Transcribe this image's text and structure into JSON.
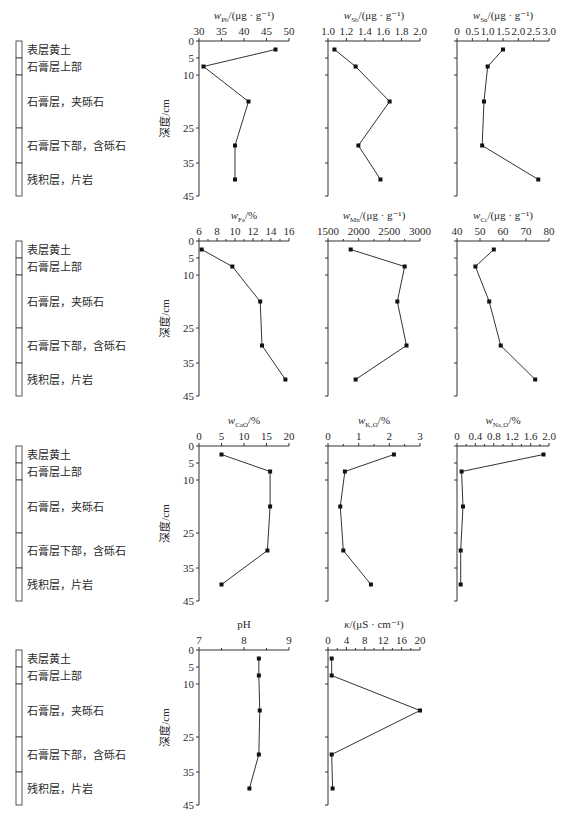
{
  "figure": {
    "depth_axis": {
      "label": "深度/cm",
      "ticks": [
        0,
        5,
        10,
        25,
        35,
        45
      ],
      "tick_offsets_px": [
        0,
        17,
        34,
        87,
        122,
        155
      ],
      "axis_length_px": 155
    },
    "stratigraphy": {
      "layers": [
        {
          "label": "表层黄土",
          "top": 0,
          "bottom": 5
        },
        {
          "label": "石膏层上部",
          "top": 5,
          "bottom": 10
        },
        {
          "label": "石膏层，夹砾石",
          "top": 10,
          "bottom": 25
        },
        {
          "label": "石膏层下部，含砾石",
          "top": 25,
          "bottom": 35
        },
        {
          "label": "残积层，片岩",
          "top": 35,
          "bottom": 45
        }
      ]
    },
    "sample_depths_cm": [
      2.5,
      7.5,
      17.5,
      30,
      40
    ],
    "sample_offsets_px": [
      8.5,
      25.5,
      60.5,
      104.5,
      138.5
    ]
  },
  "chart_data": [
    {
      "type": "line",
      "row": 0,
      "col": 0,
      "title": "w_Pb/(μg·g⁻¹)",
      "title_main": "w",
      "title_sub": "Pb",
      "title_tail": "/(μg · g⁻¹)",
      "xlim": [
        30,
        50
      ],
      "xticks": [
        30,
        35,
        40,
        45,
        50
      ],
      "xtick_labels": [
        "30",
        "35",
        "40",
        "45",
        "50"
      ],
      "minor": 0,
      "ylabel": "深度/cm",
      "depths": [
        2.5,
        7.5,
        17.5,
        30,
        40
      ],
      "values": [
        47,
        31,
        41,
        38,
        38
      ]
    },
    {
      "type": "line",
      "row": 0,
      "col": 1,
      "title": "w_Sb/(μg·g⁻¹)",
      "title_main": "w",
      "title_sub": "Sb",
      "title_tail": "/(μg · g⁻¹)",
      "xlim": [
        1.0,
        2.0
      ],
      "xticks": [
        1.0,
        1.2,
        1.4,
        1.6,
        1.8,
        2.0
      ],
      "xtick_labels": [
        "1.0",
        "1.2",
        "1.4",
        "1.6",
        "1.8",
        "2.0"
      ],
      "minor": 0,
      "depths": [
        2.5,
        7.5,
        17.5,
        30,
        40
      ],
      "values": [
        1.07,
        1.3,
        1.67,
        1.33,
        1.57
      ]
    },
    {
      "type": "line",
      "row": 0,
      "col": 2,
      "title": "w_Sn/(μg·g⁻¹)",
      "title_main": "w",
      "title_sub": "Sn",
      "title_tail": "/(μg · g⁻¹)",
      "xlim": [
        0,
        3.0
      ],
      "xticks": [
        0,
        0.5,
        1.0,
        1.5,
        2.0,
        2.5,
        3.0
      ],
      "xtick_labels": [
        "0",
        "0.5",
        "1.0",
        "1.5",
        "2.0",
        "2.5",
        "3.0"
      ],
      "minor": 0,
      "depths": [
        2.5,
        7.5,
        17.5,
        30,
        40
      ],
      "values": [
        1.5,
        1.0,
        0.88,
        0.82,
        2.65
      ]
    },
    {
      "type": "line",
      "row": 1,
      "col": 0,
      "title": "w_Fe/%",
      "title_main": "w",
      "title_sub": "Fe",
      "title_tail": "/%",
      "xlim": [
        6,
        16
      ],
      "xticks": [
        6,
        8,
        10,
        12,
        14,
        16
      ],
      "xtick_labels": [
        "6",
        "8",
        "10",
        "12",
        "14",
        "16"
      ],
      "minor": 1,
      "ylabel": "深度/cm",
      "depths": [
        2.5,
        7.5,
        17.5,
        30,
        40
      ],
      "values": [
        6.3,
        9.7,
        12.8,
        13.0,
        15.6
      ]
    },
    {
      "type": "line",
      "row": 1,
      "col": 1,
      "title": "w_Mn/(μg·g⁻¹)",
      "title_main": "w",
      "title_sub": "Mn",
      "title_tail": "/(μg · g⁻¹)",
      "xlim": [
        1500,
        3000
      ],
      "xticks": [
        1500,
        2000,
        2500,
        3000
      ],
      "xtick_labels": [
        "1500",
        "2000",
        "2500",
        "3000"
      ],
      "minor": 1,
      "depths": [
        2.5,
        7.5,
        17.5,
        30,
        40
      ],
      "values": [
        1870,
        2750,
        2630,
        2780,
        1950
      ]
    },
    {
      "type": "line",
      "row": 1,
      "col": 2,
      "title": "w_Cr/(μg·g⁻¹)",
      "title_main": "w",
      "title_sub": "Cr",
      "title_tail": "/(μg · g⁻¹)",
      "xlim": [
        40,
        80
      ],
      "xticks": [
        40,
        50,
        60,
        70,
        80
      ],
      "xtick_labels": [
        "40",
        "50",
        "60",
        "70",
        "80"
      ],
      "minor": 0,
      "depths": [
        2.5,
        7.5,
        17.5,
        30,
        40
      ],
      "values": [
        56,
        48,
        54,
        59,
        74
      ]
    },
    {
      "type": "line",
      "row": 2,
      "col": 0,
      "title": "w_CaO/%",
      "title_main": "w",
      "title_sub": "CaO",
      "title_tail": "/%",
      "xlim": [
        0,
        20
      ],
      "xticks": [
        0,
        5,
        10,
        15,
        20
      ],
      "xtick_labels": [
        "0",
        "5",
        "10",
        "15",
        "20"
      ],
      "minor": 0,
      "ylabel": "深度/cm",
      "depths": [
        2.5,
        7.5,
        17.5,
        30,
        40
      ],
      "values": [
        5,
        15.8,
        15.8,
        15.2,
        5
      ]
    },
    {
      "type": "line",
      "row": 2,
      "col": 1,
      "title": "w_K2O/%",
      "title_main": "w",
      "title_sub": "K₂O",
      "title_tail": "/%",
      "xlim": [
        0,
        3
      ],
      "xticks": [
        0,
        1,
        2,
        3
      ],
      "xtick_labels": [
        "0",
        "1",
        "2",
        "3"
      ],
      "minor": 1,
      "depths": [
        2.5,
        7.5,
        17.5,
        30,
        40
      ],
      "values": [
        2.15,
        0.55,
        0.4,
        0.5,
        1.4
      ]
    },
    {
      "type": "line",
      "row": 2,
      "col": 2,
      "title": "w_Na2O/%",
      "title_main": "w",
      "title_sub": "Na₂O",
      "title_tail": "/%",
      "xlim": [
        0,
        2.0
      ],
      "xticks": [
        0,
        0.4,
        0.8,
        1.2,
        1.6,
        2.0
      ],
      "xtick_labels": [
        "0",
        "0.4",
        "0.8",
        "1.2",
        "1.6",
        "2.0"
      ],
      "minor": 1,
      "depths": [
        2.5,
        7.5,
        17.5,
        30,
        40
      ],
      "values": [
        1.88,
        0.1,
        0.13,
        0.08,
        0.08
      ]
    },
    {
      "type": "line",
      "row": 3,
      "col": 0,
      "title": "pH",
      "title_main": "pH",
      "title_sub": "",
      "title_tail": "",
      "xlim": [
        7,
        9
      ],
      "xticks": [
        7,
        8,
        9
      ],
      "xtick_labels": [
        "7",
        "8",
        "9"
      ],
      "minor": 1,
      "ylabel": "深度/cm",
      "depths": [
        2.5,
        7.5,
        17.5,
        30,
        40
      ],
      "values": [
        8.33,
        8.33,
        8.35,
        8.33,
        8.12
      ]
    },
    {
      "type": "line",
      "row": 3,
      "col": 1,
      "title": "κ/(μS·cm⁻¹)",
      "title_main": "κ",
      "title_sub": "",
      "title_tail": "/(μS · cm⁻¹)",
      "xlim": [
        0,
        20
      ],
      "xticks": [
        0,
        4,
        8,
        12,
        16,
        20
      ],
      "xtick_labels": [
        "0",
        "4",
        "8",
        "12",
        "16",
        "20"
      ],
      "minor": 1,
      "depths": [
        2.5,
        7.5,
        17.5,
        30,
        40
      ],
      "values": [
        0.8,
        0.8,
        20,
        0.8,
        1.0
      ]
    }
  ],
  "layout": {
    "row_axis_y": [
      41,
      241,
      446,
      650
    ],
    "col_axis_x": [
      [
        199,
        289
      ],
      [
        328,
        420
      ],
      [
        457,
        549
      ]
    ],
    "column_x": 16,
    "column_w": 6,
    "label_x": 27
  }
}
